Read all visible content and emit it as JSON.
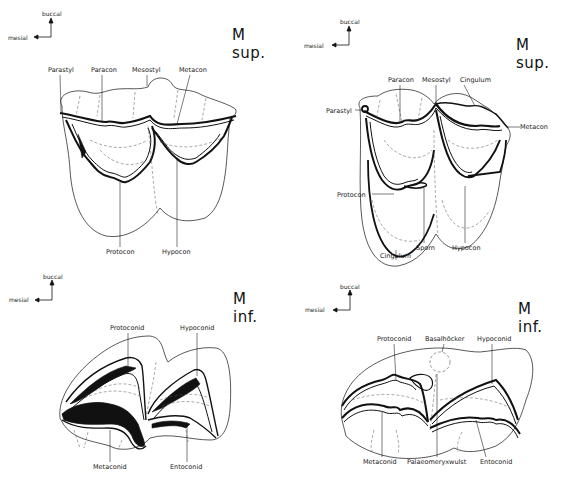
{
  "orientation": {
    "up_label": "buccal",
    "left_label": "mesial"
  },
  "panels": [
    {
      "id": "upper-left",
      "title": "M sup.",
      "labels": [
        "Parastyl",
        "Paracon",
        "Mesostyl",
        "Metacon",
        "Protocon",
        "Hypocon"
      ]
    },
    {
      "id": "upper-right",
      "title": "M sup.",
      "labels": [
        "Paracon",
        "Mesostyl",
        "Cingulum",
        "Parastyl",
        "Metacon",
        "Protocon",
        "Sporn",
        "Hypocon",
        "Cingulum"
      ]
    },
    {
      "id": "lower-left",
      "title": "M inf.",
      "labels": [
        "Protoconid",
        "Hypoconid",
        "Metaconid",
        "Entoconid"
      ]
    },
    {
      "id": "lower-right",
      "title": "M inf.",
      "labels": [
        "Protoconid",
        "Basalhöcker",
        "Hypoconid",
        "Metaconid",
        "Palaeomeryxwulst",
        "Entoconid"
      ]
    }
  ]
}
